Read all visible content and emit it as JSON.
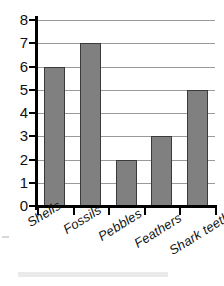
{
  "chart_data": {
    "type": "bar",
    "title": "",
    "subtitle": "",
    "xlabel": "",
    "ylabel": "",
    "categories": [
      "Shells",
      "Fossils",
      "Pebbles",
      "Feathers",
      "Shark teeth"
    ],
    "values": [
      6,
      7,
      2,
      3,
      5
    ],
    "series": [
      {
        "name": "",
        "values": [
          6,
          7,
          2,
          3,
          5
        ]
      }
    ],
    "ylim": [
      0,
      8
    ],
    "y_ticks": [
      0,
      1,
      2,
      3,
      4,
      5,
      6,
      7,
      8
    ],
    "y_tick_labels": [
      "0",
      "1",
      "2",
      "3",
      "4",
      "5",
      "6",
      "7",
      "8"
    ],
    "grid": true,
    "grid_axis": "y",
    "legend": false,
    "legend_position": "none",
    "annotations": [],
    "bar_fill_color": "#808080",
    "bar_edge_color": "#3a3a3a",
    "gridline_color": "#9a9a9a",
    "axis_color": "#000000",
    "background_color": "#ffffff",
    "x_tick_label_rotation": -32
  }
}
